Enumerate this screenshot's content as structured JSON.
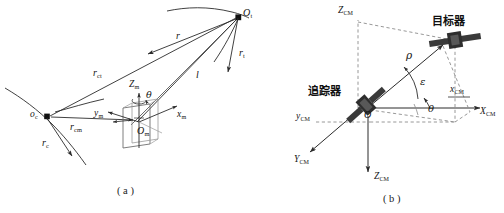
{
  "figure": {
    "width": 504,
    "height": 213,
    "background": "#ffffff",
    "stroke": "#2b2b2b",
    "dash_stroke": "#8c8c8c",
    "satellite_fill": "#3a3a3a",
    "satellite_panel": "#2e2e2e"
  },
  "panels": [
    {
      "id": "a",
      "caption": "( a )",
      "description": "Orbital geometry of chaser and target relative to Earth center"
    },
    {
      "id": "b",
      "caption": "( b )",
      "description": "Relative measurement frame with range rho, elevation epsilon, azimuth theta"
    }
  ],
  "panel_a": {
    "points": [
      {
        "name": "earth-center",
        "label": "o",
        "sub": "c",
        "x": 47,
        "y": 117
      },
      {
        "name": "target-point",
        "label": "O",
        "sub": "t",
        "x": 238,
        "y": 17
      },
      {
        "name": "chaser-origin",
        "label": "O",
        "sub": "m",
        "x": 137,
        "y": 130
      }
    ],
    "vectors": [
      {
        "name": "r-c",
        "label": "r",
        "sub": "c",
        "x": 45,
        "y": 143
      },
      {
        "name": "r-t",
        "label": "r",
        "sub": "t",
        "x": 241,
        "y": 55
      },
      {
        "name": "r-ct",
        "label": "r",
        "sub": "ct",
        "x": 97,
        "y": 74
      },
      {
        "name": "r-cm",
        "label": "r",
        "sub": "cm",
        "x": 75,
        "y": 128
      },
      {
        "name": "r-rel",
        "label": "r",
        "sub": "",
        "x": 177,
        "y": 36
      },
      {
        "name": "l-line",
        "label": "l",
        "sub": "",
        "x": 197,
        "y": 76
      }
    ],
    "axes": [
      {
        "name": "z-m-axis",
        "label": "Z",
        "sub": "m",
        "x": 133,
        "y": 86
      },
      {
        "name": "x-m-axis",
        "label": "x",
        "sub": "m",
        "x": 180,
        "y": 117
      },
      {
        "name": "y-m-axis",
        "label": "y",
        "sub": "m",
        "x": 97,
        "y": 116
      }
    ],
    "angles": [
      {
        "name": "theta-angle",
        "label": "θ",
        "x": 146,
        "y": 95
      }
    ]
  },
  "panel_b": {
    "craft": [
      {
        "name": "target-craft",
        "label": "目标器",
        "x": 432,
        "y": 23
      },
      {
        "name": "chaser-craft",
        "label": "追踪器",
        "x": 314,
        "y": 91
      }
    ],
    "origin": {
      "name": "origin-o",
      "label": "O",
      "sub": "",
      "x": 367,
      "y": 113
    },
    "axes": [
      {
        "name": "z-cm-up-axis",
        "label": "Z",
        "sub": "CM",
        "x": 348,
        "y": 11
      },
      {
        "name": "x-cm-lower-axis",
        "label": "x",
        "sub": "CM",
        "x": 454,
        "y": 89
      },
      {
        "name": "x-cm-upper-axis",
        "label": "X",
        "sub": "CM",
        "x": 483,
        "y": 103
      },
      {
        "name": "y-cm-lower-axis",
        "label": "y",
        "sub": "CM",
        "x": 301,
        "y": 117
      },
      {
        "name": "y-cm-outer-axis",
        "label": "Y",
        "sub": "CM",
        "x": 299,
        "y": 159
      },
      {
        "name": "z-cm-down-axis",
        "label": "Z",
        "sub": "CM",
        "x": 378,
        "y": 178
      }
    ],
    "angles": [
      {
        "name": "rho-range",
        "label": "ρ",
        "x": 411,
        "y": 56
      },
      {
        "name": "epsilon-elevation",
        "label": "ε",
        "x": 423,
        "y": 83
      },
      {
        "name": "theta-azimuth",
        "label": "θ",
        "x": 430,
        "y": 110
      }
    ]
  }
}
